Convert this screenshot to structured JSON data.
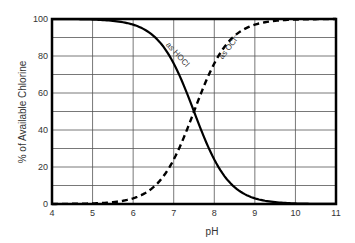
{
  "chart_data": {
    "type": "line",
    "title": "",
    "xlabel": "pH",
    "ylabel": "% of Available Chlorine",
    "xlim": [
      4,
      11
    ],
    "ylim": [
      0,
      100
    ],
    "x_ticks": [
      4,
      5,
      6,
      7,
      8,
      9,
      10,
      11
    ],
    "y_ticks": [
      0,
      20,
      40,
      60,
      80,
      100
    ],
    "grid": true,
    "grid_y_step": 10,
    "grid_x_step": 1,
    "legend": null,
    "x": [
      4.0,
      4.5,
      5.0,
      5.5,
      6.0,
      6.5,
      7.0,
      7.25,
      7.5,
      7.75,
      8.0,
      8.5,
      9.0,
      9.5,
      10.0,
      10.5,
      11.0
    ],
    "series": [
      {
        "name": "as HOCl",
        "style": "solid",
        "color": "#000000",
        "values": [
          100.0,
          99.9,
          99.7,
          99.0,
          96.9,
          90.9,
          76.0,
          64.0,
          50.0,
          36.0,
          24.0,
          9.1,
          3.1,
          1.0,
          0.3,
          0.1,
          0.0
        ]
      },
      {
        "name": "as OCl-",
        "style": "dashed",
        "color": "#000000",
        "values": [
          0.0,
          0.1,
          0.3,
          1.0,
          3.1,
          9.1,
          24.0,
          36.0,
          50.0,
          64.0,
          76.0,
          90.9,
          96.9,
          99.0,
          99.7,
          99.9,
          100.0
        ]
      }
    ],
    "annotations": [
      {
        "text": "as HOCl",
        "x": 6.8,
        "y": 86,
        "rotation": 48
      },
      {
        "text": "as OCl-",
        "x": 8.2,
        "y": 78,
        "rotation": -52
      }
    ],
    "crossover": {
      "x": 7.5,
      "y": 50
    }
  },
  "labels": {
    "xlabel": "pH",
    "ylabel": "% of Available Chlorine",
    "hocl": "as HOCl",
    "ocl": "as OCl⁻",
    "xticks": [
      "4",
      "5",
      "6",
      "7",
      "8",
      "9",
      "10",
      "11"
    ],
    "yticks": [
      "0",
      "20",
      "40",
      "60",
      "80",
      "100"
    ]
  }
}
